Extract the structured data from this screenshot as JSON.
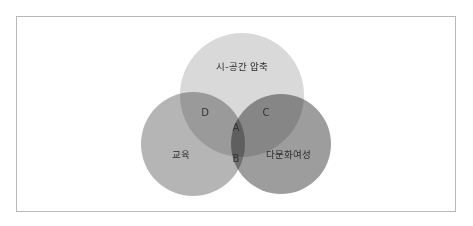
{
  "diagram": {
    "type": "venn",
    "sets": [
      {
        "name": "시-공간 압축",
        "position": "top",
        "color": "#d8d8d8"
      },
      {
        "name": "교육",
        "position": "left",
        "color": "#a9a9a9"
      },
      {
        "name": "다문화여성",
        "position": "right",
        "color": "#8f8f8f"
      }
    ],
    "regions": {
      "A": "A",
      "B": "B",
      "C": "C",
      "D": "D"
    }
  }
}
